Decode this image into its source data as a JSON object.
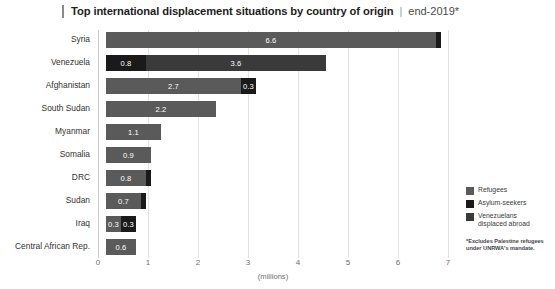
{
  "header": {
    "title": "Top international displacement situations by country of origin",
    "separator": "|",
    "subtitle": "end-2019*"
  },
  "legend": {
    "position": "right",
    "items": [
      {
        "label": "Refugees",
        "color": "#5a5a5a",
        "icon": "square-swatch-icon"
      },
      {
        "label": "Asylum-seekers",
        "color": "#1a1a1a",
        "icon": "square-swatch-icon"
      },
      {
        "label": "Venezuelans\ndisplaced abroad",
        "color": "#3a3a3a",
        "icon": "square-swatch-icon"
      }
    ]
  },
  "footnote": "*Excludes Palestine refugees under UNRWA's mandate.",
  "axis": {
    "x_label": "(millions)",
    "ticks": [
      "0",
      "1",
      "2",
      "3",
      "4",
      "5",
      "6",
      "7"
    ]
  },
  "chart_data": {
    "type": "bar",
    "orientation": "horizontal",
    "stacked": true,
    "title": "Top international displacement situations by country of origin",
    "subtitle": "end-2019*",
    "xlabel": "(millions)",
    "ylabel": "",
    "xlim": [
      0,
      7
    ],
    "grid": true,
    "legend_position": "right",
    "categories": [
      "Syria",
      "Venezuela",
      "Afghanistan",
      "South Sudan",
      "Myanmar",
      "Somalia",
      "DRC",
      "Sudan",
      "Iraq",
      "Central African Rep."
    ],
    "series": [
      {
        "name": "Refugees",
        "color": "#5a5a5a",
        "values": [
          6.6,
          0,
          2.7,
          2.2,
          1.1,
          0.9,
          0.8,
          0.7,
          0.3,
          0.6
        ]
      },
      {
        "name": "Asylum-seekers",
        "color": "#1a1a1a",
        "values": [
          0.1,
          0.8,
          0.3,
          0,
          0,
          0,
          0.1,
          0.1,
          0.3,
          0
        ]
      },
      {
        "name": "Venezuelans displaced abroad",
        "color": "#3a3a3a",
        "values": [
          0,
          3.6,
          0,
          0,
          0,
          0,
          0,
          0,
          0,
          0
        ]
      }
    ],
    "bars": [
      {
        "category": "Syria",
        "segments": [
          {
            "series": "Refugees",
            "value": 6.6,
            "label": "6.6",
            "show_label": true
          },
          {
            "series": "Asylum-seekers",
            "value": 0.1,
            "label": "0.1",
            "show_label": false
          }
        ]
      },
      {
        "category": "Venezuela",
        "segments": [
          {
            "series": "Asylum-seekers",
            "value": 0.8,
            "label": "0.8",
            "show_label": true
          },
          {
            "series": "Venezuelans displaced abroad",
            "value": 3.6,
            "label": "3.6",
            "show_label": true
          }
        ]
      },
      {
        "category": "Afghanistan",
        "segments": [
          {
            "series": "Refugees",
            "value": 2.7,
            "label": "2.7",
            "show_label": true
          },
          {
            "series": "Asylum-seekers",
            "value": 0.3,
            "label": "0.3",
            "show_label": true
          }
        ]
      },
      {
        "category": "South Sudan",
        "segments": [
          {
            "series": "Refugees",
            "value": 2.2,
            "label": "2.2",
            "show_label": true
          }
        ]
      },
      {
        "category": "Myanmar",
        "segments": [
          {
            "series": "Refugees",
            "value": 1.1,
            "label": "1.1",
            "show_label": true
          }
        ]
      },
      {
        "category": "Somalia",
        "segments": [
          {
            "series": "Refugees",
            "value": 0.9,
            "label": "0.9",
            "show_label": true
          }
        ]
      },
      {
        "category": "DRC",
        "segments": [
          {
            "series": "Refugees",
            "value": 0.8,
            "label": "0.8",
            "show_label": true
          },
          {
            "series": "Asylum-seekers",
            "value": 0.1,
            "label": "0.1",
            "show_label": false
          }
        ]
      },
      {
        "category": "Sudan",
        "segments": [
          {
            "series": "Refugees",
            "value": 0.7,
            "label": "0.7",
            "show_label": true
          },
          {
            "series": "Asylum-seekers",
            "value": 0.1,
            "label": "0.1",
            "show_label": false
          }
        ]
      },
      {
        "category": "Iraq",
        "segments": [
          {
            "series": "Refugees",
            "value": 0.3,
            "label": "0.3",
            "show_label": true
          },
          {
            "series": "Asylum-seekers",
            "value": 0.3,
            "label": "0.3",
            "show_label": true
          }
        ]
      },
      {
        "category": "Central African Rep.",
        "segments": [
          {
            "series": "Refugees",
            "value": 0.6,
            "label": "0.6",
            "show_label": true
          }
        ]
      }
    ]
  }
}
